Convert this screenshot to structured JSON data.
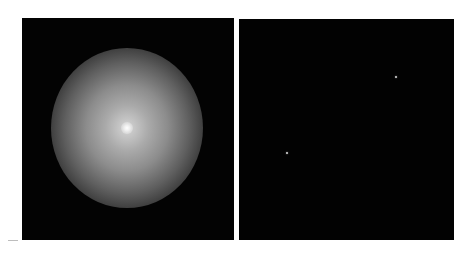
{
  "figure": {
    "panels": [
      {
        "id": "left",
        "description": "diffuse radial glow centered in dark field",
        "background": "#030303",
        "glow_center": [
          127,
          128
        ],
        "glow_radius_px": 78
      },
      {
        "id": "right",
        "description": "dark field with two faint point sources",
        "background": "#020202",
        "points": [
          {
            "x": 396,
            "y": 77
          },
          {
            "x": 287,
            "y": 153
          }
        ]
      }
    ],
    "colors": {
      "page_background": "#ffffff",
      "panel_background": "#030303",
      "glow_peak": "#ebebeb",
      "speck": "#d8d8d8"
    }
  }
}
